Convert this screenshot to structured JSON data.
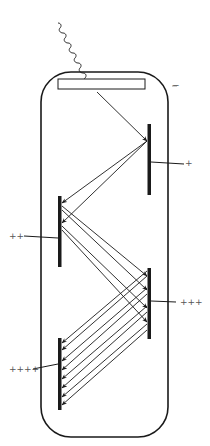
{
  "diagram": {
    "colors": {
      "stroke": "#1a1a1a",
      "label": "#555555",
      "background": "#ffffff"
    },
    "components": {
      "incoming_photon": "wavy-line",
      "photocathode": "rectangle",
      "tube_envelope": "rounded-rectangle",
      "dynodes": 4
    },
    "labels": {
      "cathode": "−",
      "dynode1": "+",
      "dynode2": "++",
      "dynode3": "+++",
      "dynode4": "++++"
    }
  }
}
